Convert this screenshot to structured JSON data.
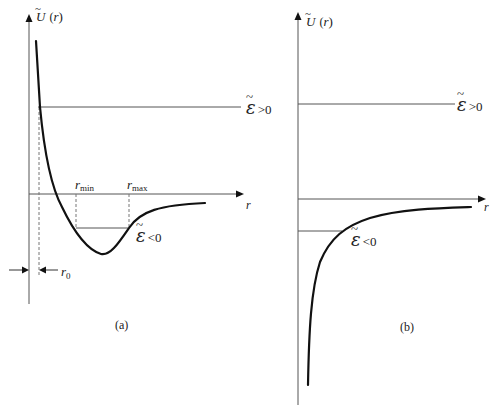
{
  "diagram": {
    "panels": [
      {
        "id": "a",
        "caption": "(a)",
        "y_axis_label_main": "U",
        "y_axis_label_arg": "(r)",
        "x_axis_label": "r",
        "energy_positive_label": "ε̃ >0",
        "energy_positive_sym": "ε",
        "energy_positive_rel": ">0",
        "energy_negative_sym": "ε",
        "energy_negative_rel": "<0",
        "r_min_label": "r",
        "r_min_sub": "min",
        "r_max_label": "r",
        "r_max_sub": "max",
        "r0_label": "r",
        "r0_sub": "0",
        "curve_description": "Potential well: steep repulsive wall near r0, minimum below zero, asymptotic approach to zero"
      },
      {
        "id": "b",
        "caption": "(b)",
        "y_axis_label_main": "U",
        "y_axis_label_arg": "(r)",
        "x_axis_label": "r",
        "energy_positive_sym": "ε",
        "energy_positive_rel": ">0",
        "energy_negative_sym": "ε",
        "energy_negative_rel": "<0",
        "curve_description": "Attractive potential diverging to -∞ at r→0 and approaching zero from below"
      }
    ],
    "colors": {
      "line": "#111111",
      "axis": "#444444",
      "text": "#222222"
    }
  }
}
